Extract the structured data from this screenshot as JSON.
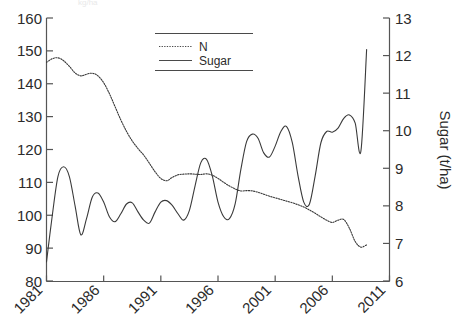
{
  "figure": {
    "clipped_top_text": "kg/ha"
  },
  "legend": {
    "position": "top-center-inside",
    "entries": [
      {
        "label": "N",
        "style": "dotted",
        "swatch": "n-line-swatch"
      },
      {
        "label": "Sugar",
        "style": "solid",
        "swatch": "sugar-line-swatch"
      }
    ]
  },
  "axes": {
    "left": {
      "ticks": [
        "80",
        "90",
        "100",
        "110",
        "120",
        "130",
        "140",
        "150",
        "160"
      ],
      "min": 80,
      "max": 160,
      "step": 10,
      "title": ""
    },
    "right": {
      "ticks": [
        "6",
        "7",
        "8",
        "9",
        "10",
        "11",
        "12",
        "13"
      ],
      "min": 6,
      "max": 13,
      "step": 1,
      "title": "Sugar (t/ha)"
    },
    "bottom": {
      "ticks": [
        "1981",
        "1986",
        "1991",
        "1996",
        "2001",
        "2006",
        "2011"
      ],
      "min": 1981,
      "max": 2011,
      "step": 5,
      "title": "",
      "label_rotation_deg": -45
    }
  },
  "colors": {
    "axis": "#555555",
    "n_series": "#3a3a3a",
    "sugar_series": "#3a3a3a",
    "background": "#ffffff"
  },
  "chart_data": {
    "type": "line",
    "title": "",
    "xlabel": "",
    "ylabel": "",
    "y2label": "Sugar (t/ha)",
    "grid": false,
    "legend_position": "top-center",
    "xlim": [
      1981,
      2011
    ],
    "ylim": [
      80,
      160
    ],
    "y2lim": [
      6,
      13
    ],
    "x": [
      1981,
      1981.5,
      1982,
      1982.5,
      1983,
      1983.5,
      1984,
      1984.5,
      1985,
      1985.5,
      1986,
      1986.5,
      1987,
      1987.5,
      1988,
      1988.5,
      1989,
      1989.5,
      1990,
      1990.5,
      1991,
      1991.5,
      1992,
      1992.5,
      1993,
      1993.5,
      1994,
      1994.5,
      1995,
      1995.5,
      1996,
      1996.5,
      1997,
      1997.5,
      1998,
      1998.5,
      1999,
      1999.5,
      2000,
      2000.5,
      2001,
      2001.5,
      2002,
      2002.5,
      2003,
      2003.5,
      2004,
      2004.5,
      2005,
      2005.5,
      2006,
      2006.5,
      2007,
      2007.5,
      2008,
      2008.5,
      2009
    ],
    "series": [
      {
        "name": "N",
        "axis": "left",
        "unit": "kg/ha",
        "style": "dotted",
        "values": [
          146.5,
          147.6,
          147.9,
          147.0,
          145.3,
          143.3,
          142.4,
          142.9,
          143.2,
          142.4,
          140.3,
          137.0,
          133.0,
          129.0,
          125.5,
          122.6,
          120.3,
          118.3,
          115.8,
          113.2,
          111.2,
          110.5,
          111.5,
          112.3,
          112.5,
          112.6,
          112.5,
          112.4,
          112.6,
          112.2,
          111.2,
          110.0,
          108.9,
          108.0,
          107.4,
          107.5,
          107.4,
          107.0,
          106.4,
          105.8,
          105.3,
          104.8,
          104.3,
          103.8,
          103.2,
          102.5,
          101.6,
          100.6,
          99.5,
          98.5,
          97.8,
          98.5,
          98.7,
          96.0,
          92.0,
          90.3,
          91.0
        ]
      },
      {
        "name": "Sugar",
        "axis": "right",
        "unit": "t/ha",
        "style": "solid",
        "values_left_scale": [
          86.0,
          100.0,
          112.0,
          115.0,
          112.0,
          103.0,
          94.0,
          99.0,
          105.5,
          106.8,
          104.0,
          99.5,
          98.0,
          100.5,
          103.5,
          103.8,
          101.0,
          98.5,
          97.5,
          101.0,
          104.0,
          104.5,
          103.0,
          100.5,
          98.5,
          101.5,
          109.0,
          116.0,
          117.0,
          112.0,
          104.0,
          99.5,
          99.0,
          103.5,
          114.0,
          122.5,
          124.8,
          123.5,
          119.0,
          117.8,
          121.0,
          125.5,
          127.0,
          122.0,
          112.0,
          104.0,
          103.5,
          112.0,
          122.0,
          125.5,
          125.3,
          126.5,
          129.5,
          130.5,
          128.0,
          119.5,
          150.5
        ],
        "values": [
          6.51,
          7.73,
          8.78,
          9.04,
          8.78,
          8.0,
          7.23,
          7.66,
          8.23,
          8.34,
          8.1,
          7.71,
          7.58,
          7.79,
          8.05,
          8.08,
          7.84,
          7.62,
          7.54,
          7.84,
          8.1,
          8.14,
          8.01,
          7.79,
          7.62,
          7.88,
          8.54,
          9.15,
          9.24,
          8.8,
          8.1,
          7.71,
          7.66,
          8.05,
          8.97,
          9.71,
          9.91,
          9.8,
          9.41,
          9.3,
          9.59,
          9.98,
          10.11,
          9.68,
          8.8,
          8.1,
          8.05,
          8.8,
          9.68,
          9.98,
          9.96,
          10.07,
          10.33,
          10.42,
          10.2,
          9.46,
          12.16
        ]
      }
    ]
  }
}
